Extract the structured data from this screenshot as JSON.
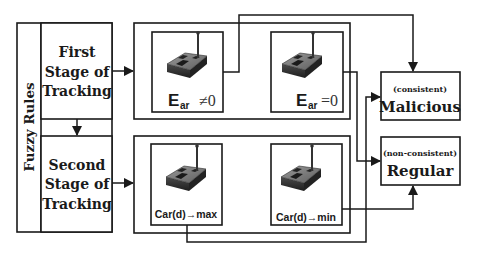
{
  "diagram": {
    "fuzzy_rules": {
      "label": "Fuzzy Rules"
    },
    "first_stage": {
      "lines": [
        "First",
        "Stage of",
        "Tracking"
      ]
    },
    "second_stage": {
      "lines": [
        "Second",
        "Stage of",
        "Tracking"
      ]
    },
    "first_stage_nodes": [
      {
        "icon": "sensor-node-icon",
        "symbol": "E",
        "subscript": "ar",
        "relation": "≠0"
      },
      {
        "icon": "sensor-node-icon",
        "symbol": "E",
        "subscript": "ar",
        "relation": "=0"
      }
    ],
    "second_stage_nodes": [
      {
        "icon": "sensor-node-icon",
        "label": "Car(d)→max"
      },
      {
        "icon": "sensor-node-icon",
        "label": "Car(d)→min"
      }
    ],
    "outcomes": {
      "malicious": {
        "qualifier": "(consistent)",
        "label": "Malicious"
      },
      "regular": {
        "qualifier": "(non-consistent)",
        "label": "Regular"
      }
    },
    "connections": [
      {
        "from": "First Stage of Tracking",
        "to": "Second Stage of Tracking"
      },
      {
        "from": "First Stage of Tracking",
        "to": "first-stage-node-group"
      },
      {
        "from": "Second Stage of Tracking",
        "to": "second-stage-node-group"
      },
      {
        "from": "E_ar ≠0",
        "to": "Malicious"
      },
      {
        "from": "E_ar =0",
        "to": "Regular"
      },
      {
        "from": "Car(d)→max",
        "to": "Malicious"
      },
      {
        "from": "Car(d)→min",
        "to": "Regular"
      }
    ],
    "colors": {
      "line": "#1a1a1a",
      "background": "#ffffff",
      "device_top": "#7a7a7a",
      "device_side": "#333333"
    }
  }
}
